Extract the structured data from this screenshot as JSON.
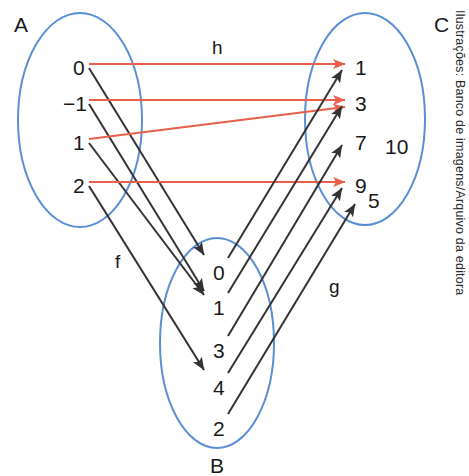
{
  "figure": {
    "type": "set-mapping-diagram",
    "background_color": "#ffffff",
    "ellipse_stroke": "#5b8fd4",
    "arrow_color_f": "#333333",
    "arrow_color_g": "#333333",
    "arrow_color_h": "#e8604c",
    "credit": "Ilustrações: Banco de imagens/Arquivo da editora"
  },
  "sets": {
    "A": {
      "label": "A",
      "label_pos": {
        "x": 14,
        "y": 14
      },
      "ellipse": {
        "cx": 80,
        "cy": 120,
        "rx": 62,
        "ry": 107
      },
      "elements": [
        {
          "value": "0",
          "x": 73,
          "y": 57
        },
        {
          "value": "−1",
          "x": 63,
          "y": 93
        },
        {
          "value": "1",
          "x": 73,
          "y": 132
        },
        {
          "value": "2",
          "x": 73,
          "y": 175
        }
      ]
    },
    "B": {
      "label": "B",
      "label_pos": {
        "x": 210,
        "y": 455
      },
      "ellipse": {
        "cx": 217,
        "cy": 343,
        "rx": 57,
        "ry": 105
      },
      "elements": [
        {
          "value": "0",
          "x": 213,
          "y": 262
        },
        {
          "value": "1",
          "x": 213,
          "y": 297
        },
        {
          "value": "3",
          "x": 213,
          "y": 340
        },
        {
          "value": "4",
          "x": 213,
          "y": 377
        },
        {
          "value": "2",
          "x": 213,
          "y": 418
        }
      ]
    },
    "C": {
      "label": "C",
      "label_pos": {
        "x": 434,
        "y": 14
      },
      "ellipse": {
        "cx": 365,
        "cy": 119,
        "rx": 60,
        "ry": 106
      },
      "elements": [
        {
          "value": "1",
          "x": 355,
          "y": 57
        },
        {
          "value": "3",
          "x": 355,
          "y": 93
        },
        {
          "value": "7",
          "x": 355,
          "y": 132
        },
        {
          "value": "9",
          "x": 355,
          "y": 175
        },
        {
          "value": "10",
          "x": 385,
          "y": 136
        },
        {
          "value": "5",
          "x": 368,
          "y": 190
        }
      ]
    }
  },
  "mappings": [
    {
      "name": "f",
      "label": "f",
      "label_pos": {
        "x": 115,
        "y": 252
      },
      "from": "A",
      "to": "B",
      "color": "#333333",
      "arrows": [
        {
          "from": "0",
          "to": "0",
          "x1": 89,
          "y1": 68,
          "x2": 204,
          "y2": 255
        },
        {
          "from": "−1",
          "to": "1",
          "x1": 89,
          "y1": 104,
          "x2": 204,
          "y2": 291
        },
        {
          "from": "1",
          "to": "1",
          "x1": 89,
          "y1": 143,
          "x2": 204,
          "y2": 295
        },
        {
          "from": "2",
          "to": "4",
          "x1": 89,
          "y1": 186,
          "x2": 204,
          "y2": 370
        }
      ]
    },
    {
      "name": "h",
      "label": "h",
      "label_pos": {
        "x": 212,
        "y": 38
      },
      "from": "A",
      "to": "C",
      "color": "#e8604c",
      "arrows": [
        {
          "from": "0",
          "to": "1",
          "x1": 89,
          "y1": 64,
          "x2": 345,
          "y2": 64
        },
        {
          "from": "−1",
          "to": "3",
          "x1": 89,
          "y1": 100,
          "x2": 345,
          "y2": 100
        },
        {
          "from": "1",
          "to": "3",
          "x1": 89,
          "y1": 139,
          "x2": 345,
          "y2": 107
        },
        {
          "from": "2",
          "to": "9",
          "x1": 89,
          "y1": 182,
          "x2": 345,
          "y2": 182
        }
      ]
    },
    {
      "name": "g",
      "label": "g",
      "label_pos": {
        "x": 329,
        "y": 277
      },
      "from": "B",
      "to": "C",
      "color": "#333333",
      "arrows": [
        {
          "from": "0",
          "to": "1",
          "x1": 228,
          "y1": 258,
          "x2": 342,
          "y2": 70
        },
        {
          "from": "1",
          "to": "3",
          "x1": 228,
          "y1": 293,
          "x2": 342,
          "y2": 106
        },
        {
          "from": "3",
          "to": "7",
          "x1": 228,
          "y1": 336,
          "x2": 342,
          "y2": 145
        },
        {
          "from": "4",
          "to": "9",
          "x1": 228,
          "y1": 373,
          "x2": 342,
          "y2": 188
        },
        {
          "from": "2",
          "to": "5",
          "x1": 228,
          "y1": 414,
          "x2": 355,
          "y2": 204
        }
      ]
    }
  ]
}
